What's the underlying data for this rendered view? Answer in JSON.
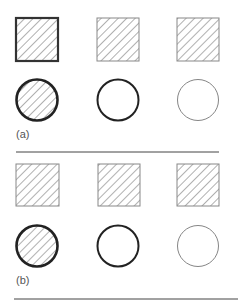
{
  "panels": [
    {
      "label": "(a)",
      "squares": [
        {
          "stroke_width": 2.2,
          "stroke": "#333333",
          "hatched": true
        },
        {
          "stroke_width": 1,
          "stroke": "#888888",
          "hatched": true
        },
        {
          "stroke_width": 1,
          "stroke": "#888888",
          "hatched": true
        }
      ],
      "circles": [
        {
          "stroke_width": 2.6,
          "stroke": "#222222",
          "hatched": true
        },
        {
          "stroke_width": 2,
          "stroke": "#222222",
          "hatched": false
        },
        {
          "stroke_width": 0.9,
          "stroke": "#777777",
          "hatched": false
        }
      ]
    },
    {
      "label": "(b)",
      "squares": [
        {
          "stroke_width": 1,
          "stroke": "#888888",
          "hatched": true
        },
        {
          "stroke_width": 1,
          "stroke": "#888888",
          "hatched": true
        },
        {
          "stroke_width": 1,
          "stroke": "#888888",
          "hatched": true
        }
      ],
      "circles": [
        {
          "stroke_width": 2.6,
          "stroke": "#222222",
          "hatched": true
        },
        {
          "stroke_width": 2,
          "stroke": "#222222",
          "hatched": false
        },
        {
          "stroke_width": 0.9,
          "stroke": "#777777",
          "hatched": false
        }
      ]
    }
  ],
  "colors": {
    "hatch": "#7a7a7a",
    "divider": "#444444",
    "background": "#ffffff"
  }
}
